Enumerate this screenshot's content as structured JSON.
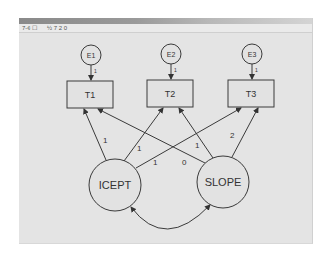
{
  "window": {
    "toolbar_left": "7-¢ ☐",
    "toolbar_right": "½ 7 2 0"
  },
  "colors": {
    "background": "#ffffff",
    "canvas": "#e4e4e4",
    "stroke": "#3a3a3a",
    "node_fill": "#e2e2e2"
  },
  "diagram": {
    "errors": [
      {
        "id": "E1",
        "label": "E1",
        "cx": 91,
        "cy": 55,
        "r": 10,
        "path_label": "1"
      },
      {
        "id": "E2",
        "label": "E2",
        "cx": 171,
        "cy": 54,
        "r": 10,
        "path_label": "1"
      },
      {
        "id": "E3",
        "label": "E3",
        "cx": 252,
        "cy": 54,
        "r": 10,
        "path_label": "1"
      }
    ],
    "observed": [
      {
        "id": "T1",
        "label": "T1",
        "x": 67,
        "y": 81,
        "w": 46,
        "h": 27
      },
      {
        "id": "T2",
        "label": "T2",
        "x": 147,
        "y": 80,
        "w": 46,
        "h": 27
      },
      {
        "id": "T3",
        "label": "T3",
        "x": 228,
        "y": 80,
        "w": 46,
        "h": 27
      }
    ],
    "latent": [
      {
        "id": "ICEPT",
        "label": "ICEPT",
        "cx": 115,
        "cy": 185,
        "r": 26
      },
      {
        "id": "SLOPE",
        "label": "SLOPE",
        "cx": 223,
        "cy": 182,
        "r": 26
      }
    ],
    "loadings": [
      {
        "from": "ICEPT",
        "to": "T1",
        "label": "1"
      },
      {
        "from": "ICEPT",
        "to": "T2",
        "label": "1"
      },
      {
        "from": "ICEPT",
        "to": "T3",
        "label": "1"
      },
      {
        "from": "SLOPE",
        "to": "T1",
        "label": "0"
      },
      {
        "from": "SLOPE",
        "to": "T2",
        "label": "1"
      },
      {
        "from": "SLOPE",
        "to": "T3",
        "label": "2"
      }
    ],
    "covariance": {
      "between": [
        "ICEPT",
        "SLOPE"
      ],
      "label": ""
    }
  }
}
